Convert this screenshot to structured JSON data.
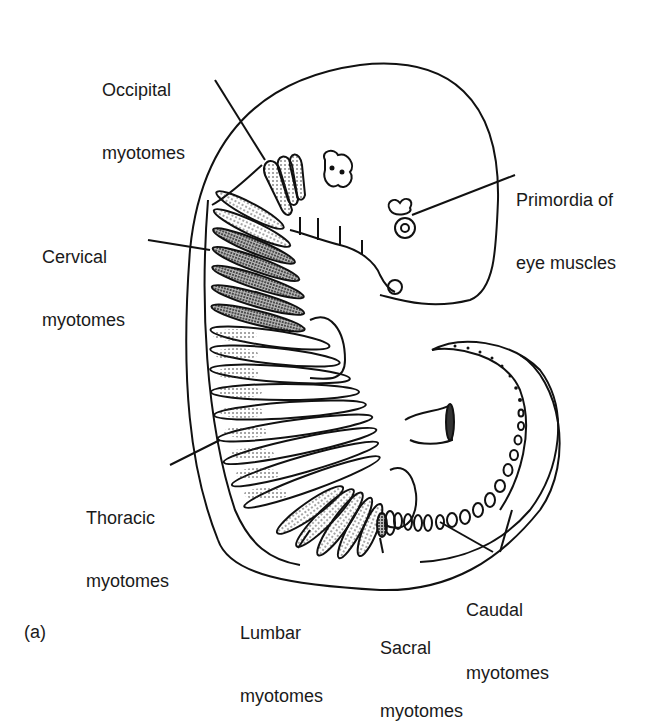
{
  "figure": {
    "panel_label": "(a)",
    "labels": {
      "occipital": {
        "line1": "Occipital",
        "line2": "myotomes"
      },
      "cervical": {
        "line1": "Cervical",
        "line2": "myotomes"
      },
      "thoracic": {
        "line1": "Thoracic",
        "line2": "myotomes"
      },
      "lumbar": {
        "line1": "Lumbar",
        "line2": "myotomes"
      },
      "sacral": {
        "line1": "Sacral",
        "line2": "myotomes"
      },
      "caudal": {
        "line1": "Caudal",
        "line2": "myotomes"
      },
      "eye": {
        "line1": "Primordia of",
        "line2": "eye muscles"
      }
    },
    "colors": {
      "line": "#111111",
      "background": "#ffffff"
    }
  }
}
